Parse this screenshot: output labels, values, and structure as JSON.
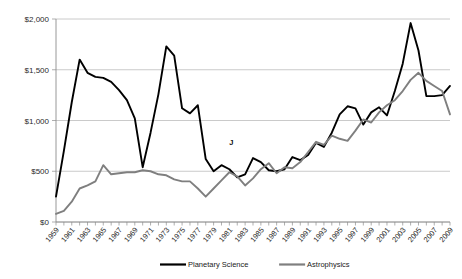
{
  "chart_data": {
    "type": "line",
    "title": "",
    "xlabel": "",
    "ylabel": "",
    "ylim": [
      0,
      2000
    ],
    "ytick_values": [
      0,
      500,
      1000,
      1500,
      2000
    ],
    "ytick_labels": [
      "$0",
      "$500",
      "$1,000",
      "$1,500",
      "$2,000"
    ],
    "grid": true,
    "legend_position": "bottom",
    "annotations": [
      {
        "text": "J",
        "x": 1981,
        "y": 760
      }
    ],
    "x": [
      1959,
      1960,
      1961,
      1962,
      1963,
      1964,
      1965,
      1966,
      1967,
      1968,
      1969,
      1970,
      1971,
      1972,
      1973,
      1974,
      1975,
      1976,
      1977,
      1978,
      1979,
      1980,
      1981,
      1982,
      1983,
      1984,
      1985,
      1986,
      1987,
      1988,
      1989,
      1990,
      1991,
      1992,
      1993,
      1994,
      1995,
      1996,
      1997,
      1998,
      1999,
      2000,
      2001,
      2002,
      2003,
      2004,
      2005,
      2006,
      2007,
      2008,
      2009
    ],
    "xtick_labels": [
      "1959",
      "1961",
      "1963",
      "1965",
      "1967",
      "1969",
      "1971",
      "1973",
      "1975",
      "1977",
      "1979",
      "1981",
      "1983",
      "1985",
      "1987",
      "1989",
      "1991",
      "1993",
      "1995",
      "1997",
      "1999",
      "2001",
      "2003",
      "2005",
      "2007",
      "2009"
    ],
    "series": [
      {
        "name": "Planetary Science",
        "color": "#000000",
        "values": [
          250,
          700,
          1180,
          1600,
          1470,
          1430,
          1420,
          1380,
          1300,
          1200,
          1020,
          540,
          880,
          1260,
          1730,
          1640,
          1120,
          1070,
          1150,
          620,
          500,
          560,
          520,
          440,
          470,
          630,
          590,
          510,
          500,
          520,
          640,
          610,
          660,
          780,
          740,
          880,
          1060,
          1140,
          1120,
          960,
          1080,
          1130,
          1050,
          1290,
          1560,
          1960,
          1690,
          1240,
          1240,
          1250,
          1340
        ]
      },
      {
        "name": "Astrophysics",
        "color": "#7f7f7f",
        "values": [
          80,
          110,
          200,
          330,
          360,
          400,
          560,
          470,
          480,
          490,
          490,
          510,
          500,
          470,
          460,
          420,
          400,
          400,
          330,
          250,
          330,
          410,
          490,
          450,
          360,
          430,
          520,
          580,
          480,
          540,
          530,
          590,
          690,
          790,
          760,
          850,
          820,
          800,
          900,
          1010,
          980,
          1080,
          1150,
          1200,
          1290,
          1400,
          1470,
          1390,
          1340,
          1290,
          1060
        ]
      }
    ]
  },
  "legend": {
    "items": [
      {
        "label": "Planetary Science"
      },
      {
        "label": "Astrophysics"
      }
    ]
  }
}
